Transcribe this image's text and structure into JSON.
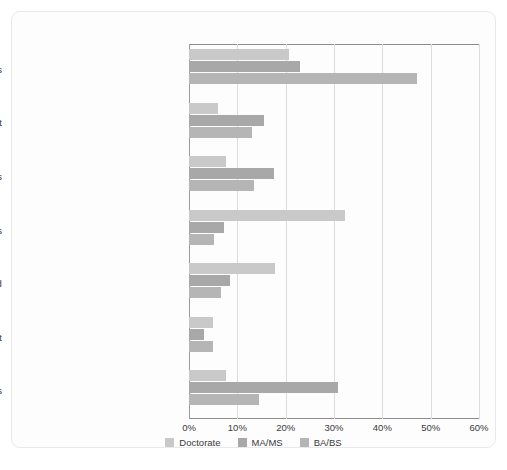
{
  "chart_data": {
    "type": "bar",
    "orientation": "horizontal",
    "title": "",
    "subtitle": "",
    "xlabel": "",
    "ylabel": "",
    "xlim": [
      0,
      60
    ],
    "grid": true,
    "legend_position": "bottom",
    "xticks": [
      "0%",
      "10%",
      "20%",
      "30%",
      "40%",
      "50%",
      "60%"
    ],
    "xtick_values": [
      0,
      10,
      20,
      30,
      40,
      50,
      60
    ],
    "categories": [
      "For-profit companies",
      "State or local government",
      "Not-for-profit organizations",
      "Universities and 4-year colleges",
      "Self-employed",
      "Federal government",
      "Other educational institutions"
    ],
    "series": [
      {
        "name": "Doctorate",
        "color": "#c9c9c9",
        "values": [
          20.6,
          6.1,
          7.6,
          32.3,
          17.8,
          4.9,
          7.6
        ]
      },
      {
        "name": "MA/MS",
        "color": "#a8a8a8",
        "values": [
          22.9,
          15.6,
          17.6,
          7.2,
          8.5,
          3.0,
          30.9
        ]
      },
      {
        "name": "BA/BS",
        "color": "#b5b5b5",
        "values": [
          47.2,
          13.0,
          13.5,
          5.2,
          6.6,
          4.9,
          14.4
        ]
      }
    ]
  },
  "legend": {
    "items": [
      {
        "label": "Doctorate",
        "color": "#c9c9c9"
      },
      {
        "label": "MA/MS",
        "color": "#a8a8a8"
      },
      {
        "label": "BA/BS",
        "color": "#b5b5b5"
      }
    ]
  },
  "colors": {
    "background": "#ffffff",
    "panel": "#fdfdfd",
    "panel_border": "#e8e9ea",
    "axis": "#8e8e8e",
    "gridline": "#dcdcdc",
    "text": "#3a3a3a"
  }
}
